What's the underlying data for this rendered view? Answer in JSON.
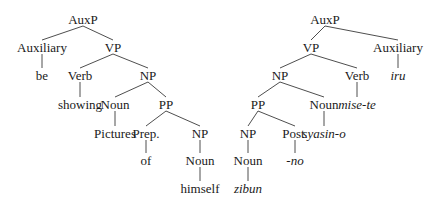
{
  "diagram": {
    "type": "syntax-tree-comparison",
    "trees": [
      {
        "id": "english",
        "nodes": [
          {
            "id": "l_auxp",
            "label": "AuxP",
            "x": 83,
            "y": 19,
            "italic": false
          },
          {
            "id": "l_aux",
            "label": "Auxiliary",
            "x": 42,
            "y": 47,
            "italic": false
          },
          {
            "id": "l_vp",
            "label": "VP",
            "x": 113,
            "y": 47,
            "italic": false
          },
          {
            "id": "l_be",
            "label": "be",
            "x": 42,
            "y": 75,
            "italic": false
          },
          {
            "id": "l_verb",
            "label": "Verb",
            "x": 80,
            "y": 75,
            "italic": false
          },
          {
            "id": "l_np1",
            "label": "NP",
            "x": 148,
            "y": 75,
            "italic": false
          },
          {
            "id": "l_showing",
            "label": "showing",
            "x": 80,
            "y": 104,
            "italic": false
          },
          {
            "id": "l_noun1",
            "label": "Noun",
            "x": 115,
            "y": 104,
            "italic": false
          },
          {
            "id": "l_pp",
            "label": "PP",
            "x": 166,
            "y": 104,
            "italic": false
          },
          {
            "id": "l_pictures",
            "label": "Pictures",
            "x": 115,
            "y": 133,
            "italic": false
          },
          {
            "id": "l_prep",
            "label": "Prep.",
            "x": 146,
            "y": 133,
            "italic": false
          },
          {
            "id": "l_np2",
            "label": "NP",
            "x": 200,
            "y": 133,
            "italic": false
          },
          {
            "id": "l_of",
            "label": "of",
            "x": 146,
            "y": 160,
            "italic": false
          },
          {
            "id": "l_noun2",
            "label": "Noun",
            "x": 200,
            "y": 160,
            "italic": false
          },
          {
            "id": "l_himself",
            "label": "himself",
            "x": 200,
            "y": 188,
            "italic": false
          }
        ],
        "edges": [
          [
            "l_auxp",
            "l_aux"
          ],
          [
            "l_auxp",
            "l_vp"
          ],
          [
            "l_aux",
            "l_be"
          ],
          [
            "l_vp",
            "l_verb"
          ],
          [
            "l_vp",
            "l_np1"
          ],
          [
            "l_verb",
            "l_showing"
          ],
          [
            "l_np1",
            "l_noun1"
          ],
          [
            "l_np1",
            "l_pp"
          ],
          [
            "l_noun1",
            "l_pictures"
          ],
          [
            "l_pp",
            "l_prep"
          ],
          [
            "l_pp",
            "l_np2"
          ],
          [
            "l_prep",
            "l_of"
          ],
          [
            "l_np2",
            "l_noun2"
          ],
          [
            "l_noun2",
            "l_himself"
          ]
        ]
      },
      {
        "id": "japanese",
        "nodes": [
          {
            "id": "r_auxp",
            "label": "AuxP",
            "x": 325,
            "y": 19,
            "italic": false
          },
          {
            "id": "r_vp",
            "label": "VP",
            "x": 311,
            "y": 47,
            "italic": false
          },
          {
            "id": "r_aux",
            "label": "Auxiliary",
            "x": 398,
            "y": 47,
            "italic": false
          },
          {
            "id": "r_np1",
            "label": "NP",
            "x": 280,
            "y": 75,
            "italic": false
          },
          {
            "id": "r_verb",
            "label": "Verb",
            "x": 357,
            "y": 75,
            "italic": false
          },
          {
            "id": "r_iru",
            "label": "iru",
            "x": 398,
            "y": 75,
            "italic": true
          },
          {
            "id": "r_pp",
            "label": "PP",
            "x": 258,
            "y": 104,
            "italic": false
          },
          {
            "id": "r_noun1",
            "label": "Noun",
            "x": 324,
            "y": 104,
            "italic": false
          },
          {
            "id": "r_misete",
            "label": "mise-te",
            "x": 357,
            "y": 104,
            "italic": true
          },
          {
            "id": "r_np2",
            "label": "NP",
            "x": 248,
            "y": 133,
            "italic": false
          },
          {
            "id": "r_post",
            "label": "Post.",
            "x": 295,
            "y": 133,
            "italic": false
          },
          {
            "id": "r_syasino",
            "label": "syasin-o",
            "x": 324,
            "y": 133,
            "italic": true
          },
          {
            "id": "r_noun2",
            "label": "Noun",
            "x": 248,
            "y": 160,
            "italic": false
          },
          {
            "id": "r_no",
            "label": "-no",
            "x": 295,
            "y": 160,
            "italic": true
          },
          {
            "id": "r_zibun",
            "label": "zibun",
            "x": 248,
            "y": 188,
            "italic": true
          }
        ],
        "edges": [
          [
            "r_auxp",
            "r_vp"
          ],
          [
            "r_auxp",
            "r_aux"
          ],
          [
            "r_aux",
            "r_iru"
          ],
          [
            "r_vp",
            "r_np1"
          ],
          [
            "r_vp",
            "r_verb"
          ],
          [
            "r_verb",
            "r_misete"
          ],
          [
            "r_np1",
            "r_pp"
          ],
          [
            "r_np1",
            "r_noun1"
          ],
          [
            "r_noun1",
            "r_syasino"
          ],
          [
            "r_pp",
            "r_np2"
          ],
          [
            "r_pp",
            "r_post"
          ],
          [
            "r_post",
            "r_no"
          ],
          [
            "r_np2",
            "r_noun2"
          ],
          [
            "r_noun2",
            "r_zibun"
          ]
        ]
      }
    ]
  },
  "labels": {
    "l_auxp": "AuxP",
    "l_aux": "Auxiliary",
    "l_vp": "VP",
    "l_be": "be",
    "l_verb": "Verb",
    "l_np1": "NP",
    "l_showing": "showing",
    "l_noun1": "Noun",
    "l_pp": "PP",
    "l_pictures": "Pictures",
    "l_prep": "Prep.",
    "l_np2": "NP",
    "l_of": "of",
    "l_noun2": "Noun",
    "l_himself": "himself",
    "r_auxp": "AuxP",
    "r_vp": "VP",
    "r_aux": "Auxiliary",
    "r_np1": "NP",
    "r_verb": "Verb",
    "r_iru": "iru",
    "r_pp": "PP",
    "r_noun1": "Noun",
    "r_misete": "mise-te",
    "r_np2": "NP",
    "r_post": "Post.",
    "r_syasino": "syasin-o",
    "r_noun2": "Noun",
    "r_no": "-no",
    "r_zibun": "zibun"
  }
}
